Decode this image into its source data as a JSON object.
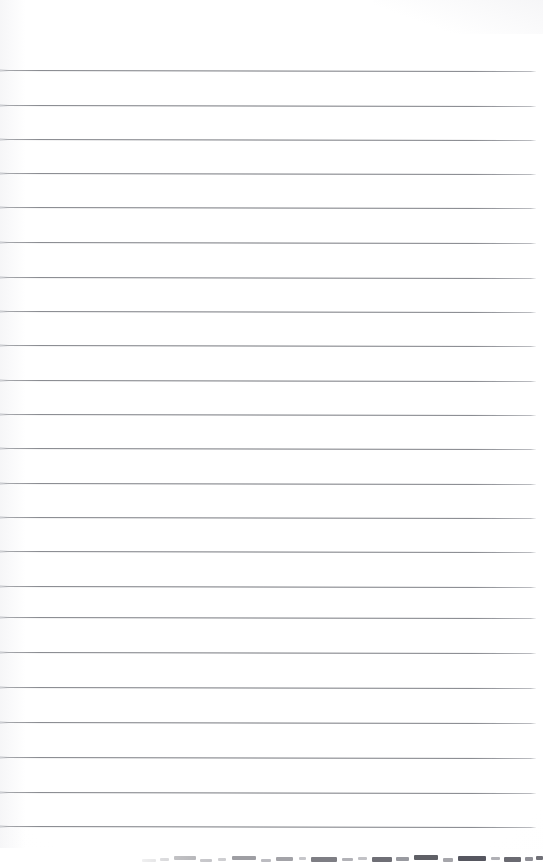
{
  "document": {
    "kind": "scanned-lined-notebook-page",
    "title": "",
    "text_content": "",
    "page_width": 543,
    "page_height": 862,
    "background_color": "#ffffff",
    "has_visible_text": false,
    "has_handwriting": false,
    "top_margin_px": 70,
    "orientation": "portrait"
  },
  "ruling": {
    "line_color": "#74767c",
    "line_count": 23,
    "first_line_y": 70,
    "line_spacing_px": 34.7,
    "line_thickness_px": 1,
    "line_start_x": 0,
    "line_end_x": 536,
    "skew_degrees": 0.12,
    "line_y_positions": [
      70,
      105,
      139,
      173,
      207,
      242,
      277,
      311,
      345,
      380,
      414,
      448,
      483,
      517,
      551,
      586,
      617,
      652,
      687,
      722,
      757,
      792,
      826
    ]
  },
  "artifacts": {
    "bottom_band": {
      "name": "scanner-edge-dash-band",
      "top_y": 848,
      "height_px": 14,
      "start_x": 140,
      "end_x": 543,
      "description": "mottled dark dashed smear along bottom scan edge",
      "dashes": [
        {
          "x": 142,
          "w": 14,
          "h": 3,
          "shade": "#d2d2d4"
        },
        {
          "x": 160,
          "w": 9,
          "h": 3,
          "shade": "#c9c9cc"
        },
        {
          "x": 174,
          "w": 22,
          "h": 4,
          "shade": "#a9a9ad"
        },
        {
          "x": 200,
          "w": 12,
          "h": 3,
          "shade": "#c0c0c4"
        },
        {
          "x": 218,
          "w": 8,
          "h": 3,
          "shade": "#cdcdd0"
        },
        {
          "x": 232,
          "w": 24,
          "h": 4,
          "shade": "#9e9ea3"
        },
        {
          "x": 261,
          "w": 10,
          "h": 3,
          "shade": "#bcbcc1"
        },
        {
          "x": 276,
          "w": 17,
          "h": 4,
          "shade": "#a3a3a8"
        },
        {
          "x": 299,
          "w": 7,
          "h": 3,
          "shade": "#c6c6ca"
        },
        {
          "x": 311,
          "w": 26,
          "h": 5,
          "shade": "#7e7e84"
        },
        {
          "x": 342,
          "w": 11,
          "h": 3,
          "shade": "#b2b2b7"
        },
        {
          "x": 358,
          "w": 9,
          "h": 3,
          "shade": "#c2c2c6"
        },
        {
          "x": 372,
          "w": 20,
          "h": 5,
          "shade": "#6f6f76"
        },
        {
          "x": 396,
          "w": 13,
          "h": 4,
          "shade": "#999aa0"
        },
        {
          "x": 414,
          "w": 24,
          "h": 5,
          "shade": "#5f6066"
        },
        {
          "x": 443,
          "w": 10,
          "h": 4,
          "shade": "#a6a6ab"
        },
        {
          "x": 458,
          "w": 28,
          "h": 5,
          "shade": "#565760"
        },
        {
          "x": 491,
          "w": 9,
          "h": 3,
          "shade": "#b0b0b5"
        },
        {
          "x": 504,
          "w": 17,
          "h": 5,
          "shade": "#6a6a71"
        },
        {
          "x": 525,
          "w": 8,
          "h": 4,
          "shade": "#8e8e95"
        },
        {
          "x": 536,
          "w": 7,
          "h": 4,
          "shade": "#707077"
        }
      ]
    }
  },
  "colors": {
    "paper": "#ffffff",
    "rule": "#74767c",
    "artifact_dark": "#565760",
    "artifact_light": "#d2d2d4"
  }
}
